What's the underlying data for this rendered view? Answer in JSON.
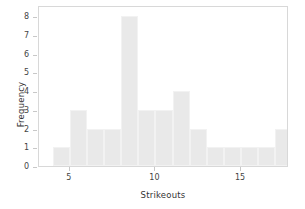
{
  "chart_data": {
    "type": "bar",
    "title": "",
    "xlabel": "Strikeouts",
    "ylabel": "Frequency",
    "bin_width": 1,
    "bin_starts": [
      4,
      5,
      6,
      7,
      8,
      9,
      10,
      11,
      12,
      13,
      14,
      15,
      16,
      17
    ],
    "categories": [
      "4",
      "5",
      "6",
      "7",
      "8",
      "9",
      "10",
      "11",
      "12",
      "13",
      "14",
      "15",
      "16",
      "17"
    ],
    "values": [
      1,
      3,
      2,
      2,
      8,
      3,
      3,
      4,
      2,
      1,
      1,
      1,
      1,
      2
    ],
    "xlim": [
      3.2,
      17.8
    ],
    "ylim": [
      0,
      8.6
    ],
    "xticks": [
      5,
      10,
      15
    ],
    "xticklabels": [
      "5",
      "10",
      "15"
    ],
    "yticks": [
      0,
      1,
      2,
      3,
      4,
      5,
      6,
      7,
      8
    ],
    "yticklabels": [
      "0",
      "1",
      "2",
      "3",
      "4",
      "5",
      "6",
      "7",
      "8"
    ],
    "grid": false,
    "legend": null,
    "bar_color": "#e9e9e9",
    "bar_edge_color": "#f2f2f2",
    "axis_color": "#d8d8d8",
    "text_color": "#333333"
  }
}
